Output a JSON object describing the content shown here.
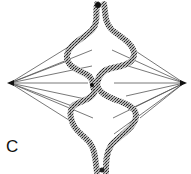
{
  "figure": {
    "panel_label": "C",
    "colors": {
      "background": "#ffffff",
      "fiber": "#555555",
      "chromosome": "#444444",
      "pole": "#111111"
    },
    "poles": [
      {
        "name": "left-pole",
        "x": 10,
        "y": 83
      },
      {
        "name": "right-pole",
        "x": 184,
        "y": 83
      }
    ]
  }
}
